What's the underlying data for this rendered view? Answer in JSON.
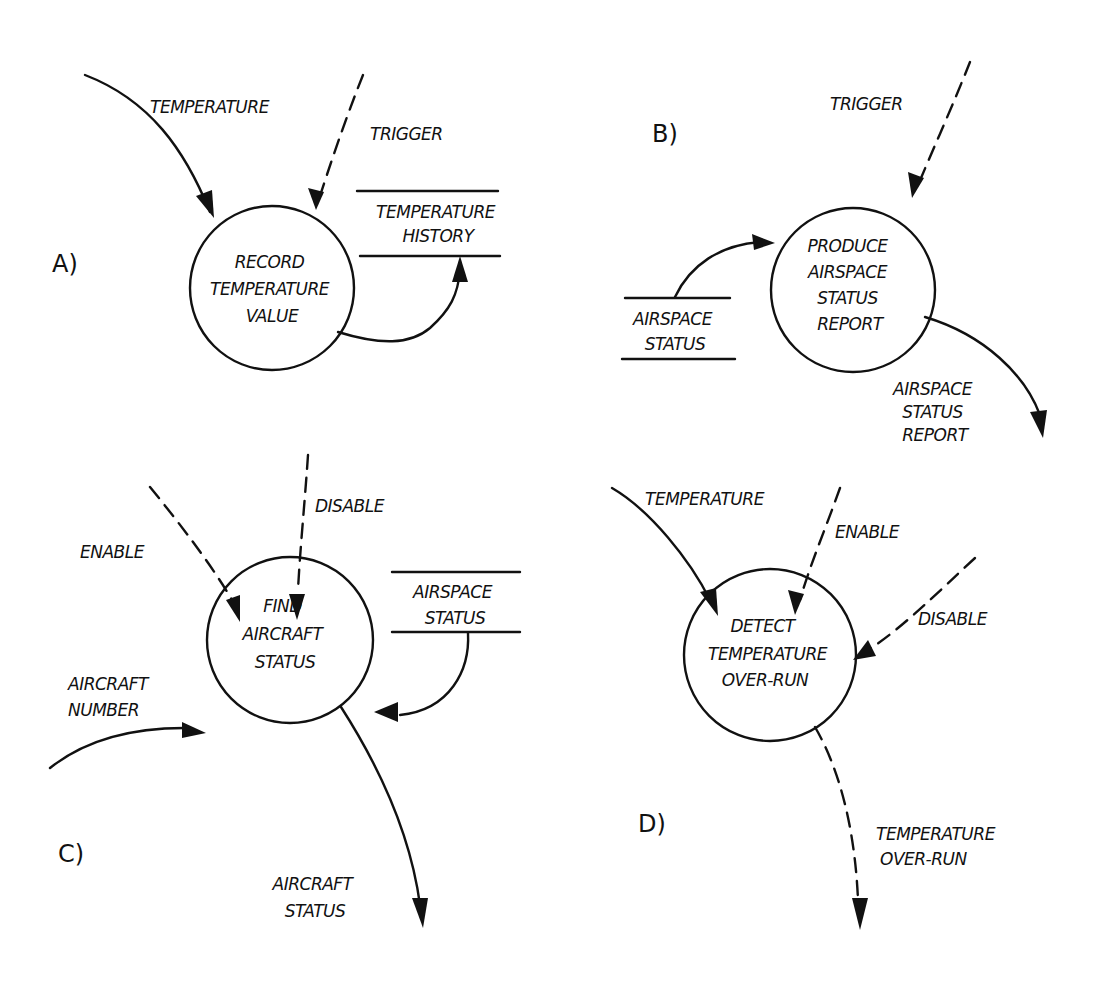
{
  "diagram": {
    "type": "data-flow-diagram",
    "style": "hand-drawn",
    "panels": [
      {
        "id": "A",
        "label": "A)",
        "process": [
          "RECORD",
          "TEMPERATURE",
          "VALUE"
        ],
        "flows": [
          {
            "label": "TEMPERATURE",
            "kind": "data",
            "direction": "in"
          },
          {
            "label": "TRIGGER",
            "kind": "control",
            "direction": "in"
          },
          {
            "label": "",
            "kind": "data",
            "direction": "out",
            "to": "TEMPERATURE HISTORY"
          }
        ],
        "store": [
          "TEMPERATURE",
          "HISTORY"
        ]
      },
      {
        "id": "B",
        "label": "B)",
        "process": [
          "PRODUCE",
          "AIRSPACE",
          "STATUS",
          "REPORT"
        ],
        "flows": [
          {
            "label": "TRIGGER",
            "kind": "control",
            "direction": "in"
          },
          {
            "label": "",
            "kind": "data",
            "direction": "in",
            "from": "AIRSPACE STATUS"
          },
          {
            "label": "AIRSPACE STATUS REPORT",
            "kind": "data",
            "direction": "out"
          }
        ],
        "flow_label_out": [
          "AIRSPACE",
          "STATUS",
          "REPORT"
        ],
        "store": [
          "AIRSPACE",
          "STATUS"
        ]
      },
      {
        "id": "C",
        "label": "C)",
        "process": [
          "FIND",
          "AIRCRAFT",
          "STATUS"
        ],
        "flows": [
          {
            "label": "ENABLE",
            "kind": "control",
            "direction": "in"
          },
          {
            "label": "DISABLE",
            "kind": "control",
            "direction": "in"
          },
          {
            "label": "AIRCRAFT NUMBER",
            "kind": "data",
            "direction": "in"
          },
          {
            "label": "",
            "kind": "data",
            "direction": "in",
            "from": "AIRSPACE STATUS"
          },
          {
            "label": "AIRCRAFT STATUS",
            "kind": "data",
            "direction": "out"
          }
        ],
        "flow_label_in": [
          "AIRCRAFT",
          "NUMBER"
        ],
        "flow_label_out": [
          "AIRCRAFT",
          "STATUS"
        ],
        "store": [
          "AIRSPACE",
          "STATUS"
        ]
      },
      {
        "id": "D",
        "label": "D)",
        "process": [
          "DETECT",
          "TEMPERATURE",
          "OVER-RUN"
        ],
        "flows": [
          {
            "label": "TEMPERATURE",
            "kind": "data",
            "direction": "in"
          },
          {
            "label": "ENABLE",
            "kind": "control",
            "direction": "in"
          },
          {
            "label": "DISABLE",
            "kind": "control",
            "direction": "in"
          },
          {
            "label": "TEMPERATURE OVER-RUN",
            "kind": "control",
            "direction": "out"
          }
        ],
        "flow_label_out": [
          "TEMPERATURE",
          "OVER-RUN"
        ]
      }
    ]
  }
}
